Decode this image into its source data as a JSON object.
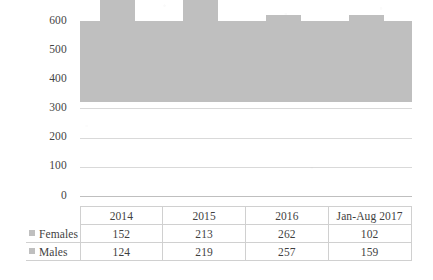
{
  "chart_data": {
    "type": "bar",
    "stacked": true,
    "categories": [
      "2014",
      "2015",
      "2016",
      "Jan-Aug 2017"
    ],
    "series": [
      {
        "name": "Females",
        "values": [
          152,
          213,
          262,
          102
        ],
        "color": "#bfbfbf"
      },
      {
        "name": "Males",
        "values": [
          124,
          219,
          257,
          159
        ],
        "color": "#bfbfbf"
      }
    ],
    "totals": [
      276,
      432,
      519,
      261
    ],
    "title": "",
    "xlabel": "",
    "ylabel": "",
    "ylim": [
      0,
      600
    ],
    "ytick_labels": [
      "600",
      "500",
      "400",
      "300",
      "200",
      "100",
      "0"
    ],
    "ytick_values": [
      600,
      500,
      400,
      300,
      200,
      100,
      0
    ],
    "grid": true,
    "legend_position": "data-table-left",
    "bar_color": "#bfbfbf",
    "gridline_color": "#d9d9d9",
    "table_border_color": "#d0d0d0"
  },
  "table": {
    "header_row": [
      "",
      "2014",
      "2015",
      "2016",
      "Jan-Aug 2017"
    ],
    "rows": [
      {
        "label": "Females",
        "values": [
          "152",
          "213",
          "262",
          "102"
        ]
      },
      {
        "label": "Males",
        "values": [
          "124",
          "219",
          "257",
          "159"
        ]
      }
    ]
  },
  "axis": {
    "y_ticks": [
      {
        "label": "600"
      },
      {
        "label": "500"
      },
      {
        "label": "400"
      },
      {
        "label": "300"
      },
      {
        "label": "200"
      },
      {
        "label": "100"
      },
      {
        "label": "0"
      }
    ]
  },
  "icons": {
    "legend_marker": "square-swatch-icon"
  }
}
